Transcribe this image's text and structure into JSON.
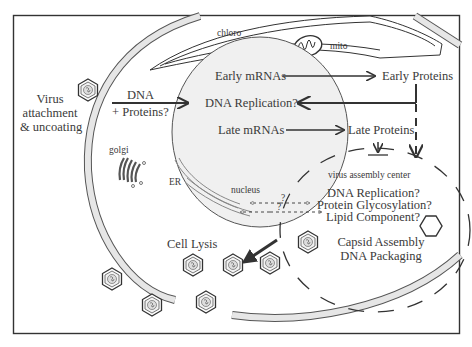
{
  "diagram": {
    "organelles": {
      "chloroplast": "chloro",
      "mitochondrion": "mito",
      "golgi": "golgi",
      "er": "ER",
      "nucleus": "nucleus",
      "assembly_center": "virus assembly center"
    },
    "entry": {
      "line1": "Virus",
      "line2": "attachment",
      "line3": "& uncoating",
      "cargo_line1": "DNA",
      "cargo_line2": "+ Proteins?"
    },
    "nucleus_steps": {
      "early_mrnas": "Early mRNAs",
      "dna_replication": "DNA Replication?",
      "late_mrnas": "Late mRNAs"
    },
    "cytoplasm_products": {
      "early_proteins": "Early Proteins",
      "late_proteins": "Late Proteins"
    },
    "assembly_center_items": {
      "dna_replication": "DNA Replication?",
      "protein_glycosylation": "Protein Glycosylation?",
      "lipid_component": "Lipid Component?",
      "capsid_line1": "Capsid Assembly",
      "capsid_line2": "DNA Packaging"
    },
    "uncertain_marks": [
      "?",
      "?"
    ],
    "exit": {
      "label": "Cell Lysis"
    },
    "colors": {
      "line": "#333333",
      "membrane_fill": "#e6e6e6",
      "nucleus_fill": "#f0f0f0",
      "background": "#ffffff"
    }
  }
}
